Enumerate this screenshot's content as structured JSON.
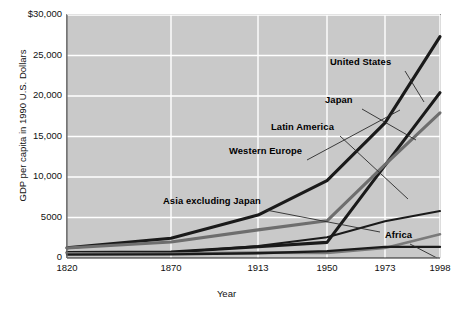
{
  "chart_data": {
    "type": "line",
    "title": "",
    "xlabel": "Year",
    "ylabel": "GDP per capita in 1990 U.S. Dollars",
    "x": [
      1820,
      1870,
      1913,
      1950,
      1973,
      1998
    ],
    "xtick_labels": [
      "1820",
      "1870",
      "1913",
      "1950",
      "1973",
      "1998"
    ],
    "ytick_labels": [
      "0",
      "5000",
      "10,000",
      "15,000",
      "20,000",
      "25,000",
      "$30,000"
    ],
    "ytick_values": [
      0,
      5000,
      10000,
      15000,
      20000,
      25000,
      30000
    ],
    "ylim": [
      0,
      30000
    ],
    "grid": true,
    "legend_position": "inline-annotations",
    "series": [
      {
        "name": "United States",
        "color": "#1a1a1a",
        "width": 3.1,
        "values": [
          1257,
          2445,
          5301,
          9561,
          16689,
          27331
        ]
      },
      {
        "name": "Japan",
        "color": "#1a1a1a",
        "width": 3.1,
        "values": [
          669,
          737,
          1387,
          1926,
          11439,
          20413
        ]
      },
      {
        "name": "Western Europe",
        "color": "#6e6e6e",
        "width": 3.1,
        "values": [
          1232,
          1974,
          3473,
          4594,
          11534,
          17921
        ]
      },
      {
        "name": "Latin America",
        "color": "#1a1a1a",
        "width": 2.0,
        "values": [
          692,
          681,
          1481,
          2554,
          4531,
          5795
        ]
      },
      {
        "name": "Asia excluding Japan",
        "color": "#7a7a7a",
        "width": 2.6,
        "values": [
          577,
          550,
          658,
          634,
          1231,
          2936
        ]
      },
      {
        "name": "Africa",
        "color": "#1a1a1a",
        "width": 2.3,
        "values": [
          418,
          444,
          585,
          852,
          1365,
          1368
        ]
      }
    ]
  },
  "annotations": [
    {
      "name": "United States",
      "x": 330,
      "y": 62,
      "lx": 405,
      "ly": 71,
      "tx": 424,
      "ty": 102
    },
    {
      "name": "Japan",
      "x": 325,
      "y": 100,
      "lx": 362,
      "ly": 109,
      "tx": 416,
      "ty": 140
    },
    {
      "name": "Latin America",
      "x": 271,
      "y": 127,
      "lx": 340,
      "ly": 136,
      "tx": 408,
      "ty": 199
    },
    {
      "name": "Western Europe",
      "x": 229,
      "y": 151,
      "lx": 307,
      "ly": 160,
      "tx": 400,
      "ty": 110
    },
    {
      "name": "Asia excluding Japan",
      "x": 163,
      "y": 201,
      "lx": 266,
      "ly": 210,
      "tx": 380,
      "ty": 232
    },
    {
      "name": "Africa",
      "x": 385,
      "y": 235,
      "lx": 410,
      "ly": 244,
      "tx": 437,
      "ty": 258
    }
  ]
}
